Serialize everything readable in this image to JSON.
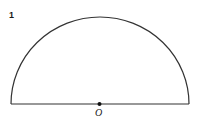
{
  "question_number": "1",
  "figure": {
    "shape": "semicircle",
    "center_label": "O",
    "stroke_color": "#333333"
  }
}
